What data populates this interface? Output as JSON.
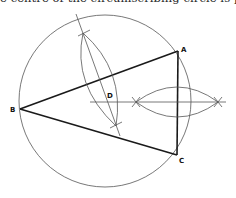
{
  "caption": "e centre of the circumscribing circle is poi",
  "diagram": {
    "points": {
      "A": {
        "label": "A",
        "x": 178,
        "y": 51
      },
      "B": {
        "label": "B",
        "x": 20,
        "y": 109
      },
      "C": {
        "label": "C",
        "x": 177,
        "y": 155
      },
      "D": {
        "label": "D"
      }
    },
    "circle": {
      "cx": 105,
      "cy": 101,
      "r": 86
    },
    "colors": {
      "thick": "#1a1a1a",
      "thin": "#555555"
    }
  }
}
